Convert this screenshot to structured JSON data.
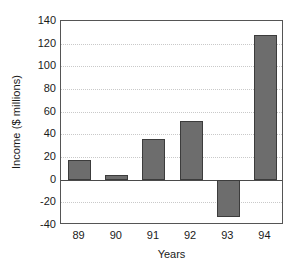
{
  "chart_data": {
    "type": "bar",
    "title": "",
    "xlabel": "Years",
    "ylabel": "Income ($ millions)",
    "categories": [
      "89",
      "90",
      "91",
      "92",
      "93",
      "94"
    ],
    "values": [
      17,
      4,
      36,
      52,
      -33,
      128
    ],
    "series": [
      {
        "name": "Income",
        "values": [
          17,
          4,
          36,
          52,
          -33,
          128
        ]
      }
    ],
    "ylim": [
      -40,
      140
    ],
    "ytick_labels": [
      "140",
      "120",
      "100",
      "80",
      "60",
      "40",
      "20",
      "0",
      "-20",
      "-40"
    ],
    "ytick_values": [
      140,
      120,
      100,
      80,
      60,
      40,
      20,
      0,
      -20,
      -40
    ],
    "ytick_step": 20,
    "grid": "horizontal-dotted",
    "legend": "none",
    "zero_line": 0,
    "bar_color": "#6d6d6d",
    "bar_edge_color": "#3c3c3c",
    "grid_color": "#c9c9c9",
    "axis_color": "#555555",
    "background_color": "#ffffff"
  }
}
